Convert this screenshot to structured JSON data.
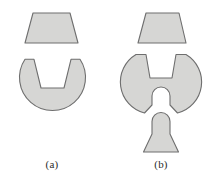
{
  "figure": {
    "background_color": "#ffffff",
    "fill_color": "#d6d6d4",
    "stroke_color": "#6e6e6e",
    "stroke_width": 1.1,
    "width": 210,
    "height": 187
  },
  "panels": [
    {
      "id": "a",
      "caption": "(a)",
      "shapes": [
        {
          "name": "trapezoid-key-a",
          "type": "trapezoid",
          "description": "isosceles trapezoid, narrow top wide bottom",
          "points": "33,13 70,13 78,43 25,43"
        },
        {
          "name": "notched-disc-a",
          "type": "circle-with-trapezoid-notch",
          "description": "disc with an inverted trapezoidal notch removed from the top",
          "circle": {
            "cx": 52,
            "cy": 91,
            "r": 33
          },
          "notch": "25,59 34,59 41,88 64,88 71,59 80,59"
        }
      ]
    },
    {
      "id": "b",
      "caption": "(b)",
      "shapes": [
        {
          "name": "trapezoid-key-b",
          "type": "trapezoid",
          "description": "isosceles trapezoid, narrow top wide bottom",
          "points": "146,13 179,13 186,43 138,43"
        },
        {
          "name": "notched-disc-b",
          "type": "circle-with-two-notches",
          "description": "disc with a trapezoidal notch cut from the top and a round-ended slot cut from the bottom",
          "circle": {
            "cx": 161,
            "cy": 85,
            "r": 32
          },
          "top_notch": "136,54 146,54 150,78 172,78 176,54 186,54",
          "bottom_slot": "152,118 152,96 170,96 170,118"
        },
        {
          "name": "plug-b",
          "type": "round-top-flared-plug",
          "description": "peg with rounded top, straight shaft and flared trapezoidal base",
          "top_cap": {
            "cx": 161,
            "cy": 121,
            "r": 9
          },
          "points": "152,121 152,135 144,152 178,152 170,135 170,121"
        }
      ]
    }
  ]
}
